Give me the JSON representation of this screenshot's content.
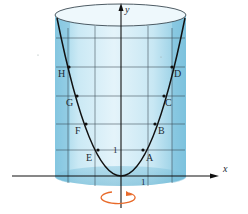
{
  "figure": {
    "colors": {
      "background": "#ffffff",
      "cylinder_fill": "#a9d8ea",
      "cylinder_light": "#d6eef7",
      "cylinder_edge": "#5aa9c8",
      "grid": "#2b3a44",
      "curve": "#111111",
      "axis": "#111111",
      "rotation_arrow": "#e86a2a"
    },
    "axes": {
      "x_label": "x",
      "y_label": "y",
      "unit_tick_y": "1",
      "unit_tick_x": "1"
    },
    "points": [
      {
        "label": "A",
        "x": 143,
        "y": 150,
        "lx": 146,
        "ly": 161
      },
      {
        "label": "B",
        "x": 155,
        "y": 124,
        "lx": 158,
        "ly": 134
      },
      {
        "label": "C",
        "x": 164,
        "y": 96,
        "lx": 165,
        "ly": 106
      },
      {
        "label": "D",
        "x": 172,
        "y": 67,
        "lx": 174,
        "ly": 77
      },
      {
        "label": "E",
        "x": 98,
        "y": 150,
        "lx": 86,
        "ly": 161
      },
      {
        "label": "F",
        "x": 86,
        "y": 124,
        "lx": 75,
        "ly": 134
      },
      {
        "label": "G",
        "x": 77,
        "y": 96,
        "lx": 66,
        "ly": 106
      },
      {
        "label": "H",
        "x": 69,
        "y": 67,
        "lx": 58,
        "ly": 77
      }
    ],
    "icons": {
      "rotation": "rotation-arrow-icon"
    }
  }
}
